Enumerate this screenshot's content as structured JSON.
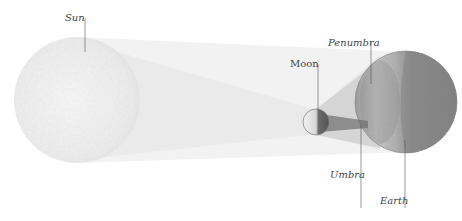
{
  "diagram": {
    "labels": {
      "sun": "Sun",
      "moon": "Moon",
      "penumbra": "Penumbra",
      "umbra": "Umbra",
      "earth": "Earth"
    },
    "bodies": {
      "sun": {
        "cx": 77,
        "cy": 100,
        "r": 63,
        "color": "#ececec"
      },
      "moon": {
        "cx": 316,
        "cy": 122,
        "r": 13,
        "color": "#d8d8d8"
      },
      "earth": {
        "cx": 406,
        "cy": 102,
        "r": 51,
        "color": "#8a8a8a"
      }
    },
    "colors": {
      "background": "#ffffff",
      "shadow_cone": "#e6e6e6",
      "penumbra": "#bdbdbd",
      "umbra": "#6e6e6e",
      "leader_line": "#555555"
    }
  }
}
